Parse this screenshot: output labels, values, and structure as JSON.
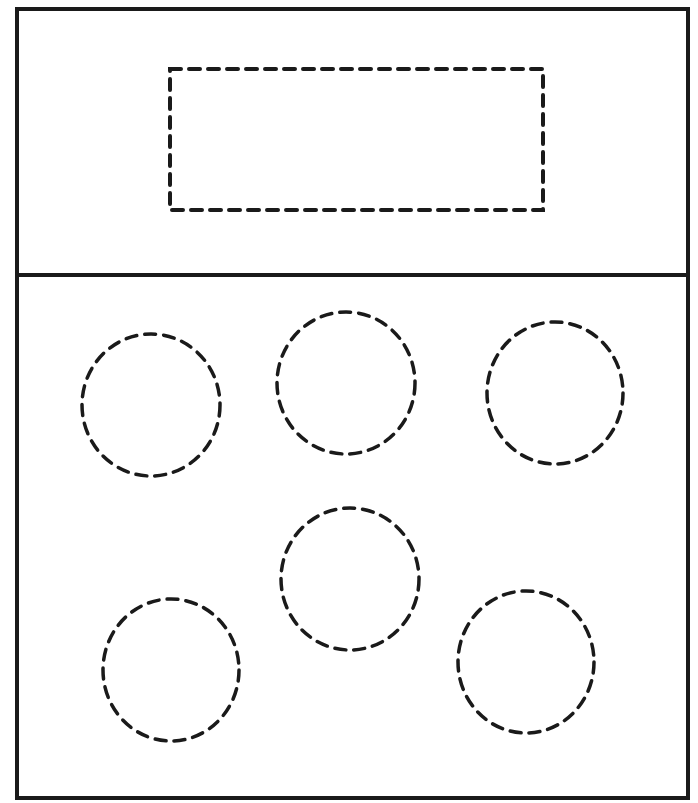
{
  "diagram": {
    "canvas": {
      "width": 698,
      "height": 803,
      "background": "#ffffff"
    },
    "stroke_color": "#1a1a1a",
    "frame": {
      "x": 17,
      "y": 9,
      "width": 671,
      "height": 789,
      "stroke_width": 4
    },
    "divider": {
      "y": 275,
      "x1": 17,
      "x2": 688,
      "stroke_width": 4
    },
    "top_panel": {
      "dashed_rectangle": {
        "x": 170,
        "y": 69,
        "width": 373,
        "height": 141,
        "stroke_width": 4,
        "dash": "11 8"
      }
    },
    "bottom_panel": {
      "dashed_circles": [
        {
          "id": "circle-1",
          "cx": 151,
          "cy": 405,
          "rx": 69,
          "ry": 71
        },
        {
          "id": "circle-2",
          "cx": 346,
          "cy": 383,
          "rx": 69,
          "ry": 71
        },
        {
          "id": "circle-3",
          "cx": 555,
          "cy": 393,
          "rx": 68,
          "ry": 71
        },
        {
          "id": "circle-4",
          "cx": 350,
          "cy": 579,
          "rx": 69,
          "ry": 71
        },
        {
          "id": "circle-5",
          "cx": 171,
          "cy": 670,
          "rx": 68,
          "ry": 71
        },
        {
          "id": "circle-6",
          "cx": 526,
          "cy": 662,
          "rx": 68,
          "ry": 71
        }
      ],
      "circle_stroke_width": 3.5,
      "circle_dash": "11 8"
    }
  }
}
